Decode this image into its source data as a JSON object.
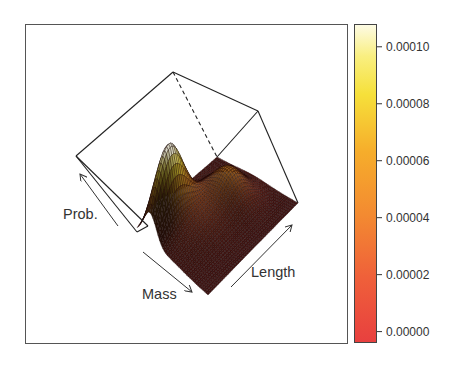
{
  "chart_data": {
    "type": "surface3d",
    "title": "",
    "axes": {
      "x": {
        "label": "Mass"
      },
      "y": {
        "label": "Length"
      },
      "z": {
        "label": "Prob."
      }
    },
    "zlim": [
      0,
      0.000107
    ],
    "peaks": [
      {
        "name": "primary",
        "mass_frac": 0.18,
        "length_frac": 0.22,
        "z": 0.000107
      },
      {
        "name": "secondary",
        "mass_frac": 0.45,
        "length_frac": 0.72,
        "z": 3.8e-05
      }
    ],
    "colorbar": {
      "ticks": [
        "0.00000",
        "0.00002",
        "0.00004",
        "0.00006",
        "0.00008",
        "0.00010"
      ],
      "tick_values": [
        0,
        2e-05,
        4e-05,
        6e-05,
        8e-05,
        0.0001
      ],
      "range": [
        -4e-06,
        0.000108
      ],
      "colors": [
        "#e8403f",
        "#f06a38",
        "#f5922e",
        "#f7bb2a",
        "#f6e43a",
        "#fdf9d8"
      ]
    },
    "grid": false,
    "legend_position": "right"
  },
  "labels": {
    "prob": "Prob.",
    "mass": "Mass",
    "length": "Length"
  }
}
